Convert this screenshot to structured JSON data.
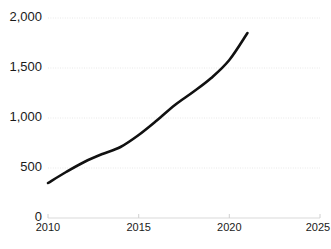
{
  "chart_data": {
    "type": "line",
    "title": "",
    "subtitle": "",
    "xlabel": "",
    "ylabel": "",
    "xlim": [
      2010,
      2025
    ],
    "ylim": [
      0,
      2000
    ],
    "grid": true,
    "legend": false,
    "legend_position": "none",
    "series_color": "#111111",
    "gridline_color": "#e8e8e8",
    "axis_color": "#d9d9d9",
    "text_color": "#1a1a1a",
    "y_ticks": [
      {
        "value": 0,
        "label": "0"
      },
      {
        "value": 500,
        "label": "500"
      },
      {
        "value": 1000,
        "label": "1,000"
      },
      {
        "value": 1500,
        "label": "1,500"
      },
      {
        "value": 2000,
        "label": "2,000"
      }
    ],
    "x_ticks": [
      {
        "value": 2010,
        "label": "2010"
      },
      {
        "value": 2015,
        "label": "2015"
      },
      {
        "value": 2020,
        "label": "2020"
      },
      {
        "value": 2025,
        "label": "2025"
      }
    ],
    "series": [
      {
        "name": "",
        "x": [
          2010,
          2011,
          2012,
          2013,
          2014,
          2015,
          2016,
          2017,
          2018,
          2019,
          2020,
          2021
        ],
        "values": [
          350,
          460,
          560,
          640,
          710,
          830,
          975,
          1130,
          1260,
          1400,
          1580,
          1850
        ]
      }
    ]
  }
}
